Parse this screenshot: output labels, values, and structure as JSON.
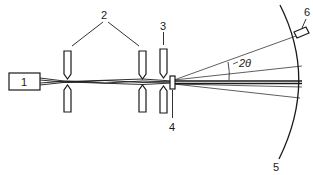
{
  "figure": {
    "type": "x-ray diffraction camera schematic",
    "labels": {
      "source": "1",
      "collimator_slits": "2",
      "guard_slit": "3",
      "sample": "4",
      "film": "5",
      "detector": "6",
      "angle": "2θ"
    },
    "components": [
      {
        "id": "1",
        "name": "x-ray source"
      },
      {
        "id": "2",
        "name": "collimating slits (pair)"
      },
      {
        "id": "3",
        "name": "guard slit"
      },
      {
        "id": "4",
        "name": "sample"
      },
      {
        "id": "5",
        "name": "film / detector arc"
      },
      {
        "id": "6",
        "name": "detector"
      }
    ],
    "colors": {
      "line": "#1a1a1a",
      "background": "#ffffff"
    }
  }
}
